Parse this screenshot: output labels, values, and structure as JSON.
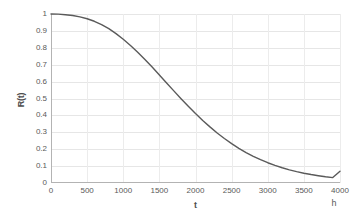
{
  "chart_data": {
    "type": "line",
    "title": "",
    "xlabel": "t",
    "ylabel": "R(t)",
    "x_unit": "h",
    "xlim": [
      0,
      4000
    ],
    "ylim": [
      0,
      1
    ],
    "grid": true,
    "legend": false,
    "legend_position": "none",
    "line_color": "#5a5a5a",
    "gridline_color": "#e6e6e6",
    "axis_color": "#b3b3b3",
    "background_color": "#ffffff",
    "x_ticks": [
      "0",
      "500",
      "1000",
      "1500",
      "2000",
      "2500",
      "3000",
      "3500",
      "4000"
    ],
    "x_tick_values": [
      0,
      500,
      1000,
      1500,
      2000,
      2500,
      3000,
      3500,
      4000
    ],
    "y_ticks": [
      "1",
      "0.9",
      "0.8",
      "0.7",
      "0.6",
      "0.5",
      "0.4",
      "0.3",
      "0.2",
      "0.1",
      "0"
    ],
    "y_tick_values": [
      1,
      0.9,
      0.8,
      0.7,
      0.6,
      0.5,
      0.4,
      0.3,
      0.2,
      0.1,
      0
    ],
    "series": [
      {
        "name": "R(t)",
        "x": [
          0,
          100,
          200,
          300,
          400,
          500,
          600,
          700,
          800,
          900,
          1000,
          1100,
          1200,
          1300,
          1400,
          1500,
          1600,
          1700,
          1800,
          1900,
          2000,
          2100,
          2200,
          2300,
          2400,
          2500,
          2600,
          2700,
          2800,
          2900,
          3000,
          3100,
          3200,
          3300,
          3400,
          3500,
          3600,
          3700,
          3800,
          3900,
          4000
        ],
        "values": [
          1.0,
          0.999,
          0.996,
          0.991,
          0.983,
          0.972,
          0.957,
          0.937,
          0.913,
          0.884,
          0.851,
          0.814,
          0.774,
          0.731,
          0.686,
          0.639,
          0.592,
          0.545,
          0.499,
          0.454,
          0.411,
          0.37,
          0.332,
          0.296,
          0.263,
          0.233,
          0.205,
          0.18,
          0.158,
          0.138,
          0.12,
          0.104,
          0.09,
          0.078,
          0.067,
          0.058,
          0.05,
          0.043,
          0.037,
          0.032,
          0.07
        ]
      }
    ]
  }
}
